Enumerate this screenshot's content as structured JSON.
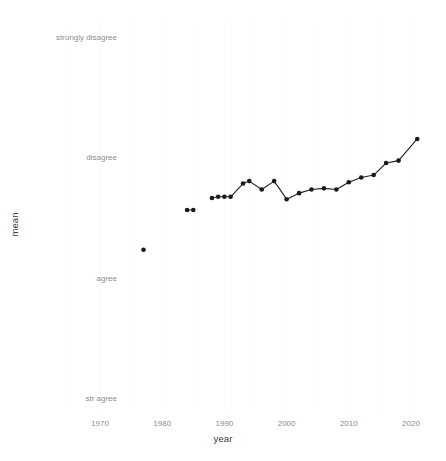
{
  "chart_data": {
    "type": "line",
    "title": "",
    "subtitle": "",
    "xlabel": "year",
    "ylabel": "mean",
    "xlim": [
      1965,
      2024
    ],
    "ylim": [
      1,
      4
    ],
    "grid": true,
    "legend": "none",
    "x_ticks": [
      1970,
      1980,
      1990,
      2000,
      2010,
      2020
    ],
    "x_tick_labels": [
      "1970",
      "1980",
      "1990",
      "2000",
      "2010",
      "2020"
    ],
    "y_ticks": [
      1,
      2,
      3,
      4
    ],
    "y_tick_labels": [
      "str agree",
      "agree",
      "disagree",
      "strongly disagree"
    ],
    "series": [
      {
        "name": "mean",
        "connected": false,
        "marker": "filled-circle",
        "color": "#1a1a1a",
        "x": [
          1977
        ],
        "values": [
          2.23
        ]
      },
      {
        "name": "mean",
        "connected": true,
        "marker": "filled-circle",
        "color": "#1a1a1a",
        "x": [
          1984,
          1985
        ],
        "values": [
          2.56,
          2.56
        ]
      },
      {
        "name": "mean",
        "connected": true,
        "marker": "filled-circle",
        "color": "#1a1a1a",
        "x": [
          1988,
          1989,
          1990,
          1991,
          1993,
          1994,
          1996,
          1998,
          2000,
          2002,
          2004,
          2006,
          2008,
          2010,
          2012,
          2014,
          2016,
          2018,
          2021
        ],
        "values": [
          2.66,
          2.67,
          2.67,
          2.67,
          2.78,
          2.8,
          2.73,
          2.8,
          2.65,
          2.7,
          2.73,
          2.74,
          2.73,
          2.79,
          2.83,
          2.85,
          2.95,
          2.97,
          3.15
        ]
      }
    ]
  },
  "axes": {
    "x_title": "year",
    "y_title": "mean"
  },
  "x_tick_labels": [
    {
      "label": "1970",
      "value": 1970
    },
    {
      "label": "1980",
      "value": 1980
    },
    {
      "label": "1990",
      "value": 1990
    },
    {
      "label": "2000",
      "value": 2000
    },
    {
      "label": "2010",
      "value": 2010
    },
    {
      "label": "2020",
      "value": 2020
    }
  ],
  "y_tick_labels": [
    {
      "label": "strongly disagree",
      "value": 4
    },
    {
      "label": "disagree",
      "value": 3
    },
    {
      "label": "agree",
      "value": 2
    },
    {
      "label": "str agree",
      "value": 1
    }
  ]
}
